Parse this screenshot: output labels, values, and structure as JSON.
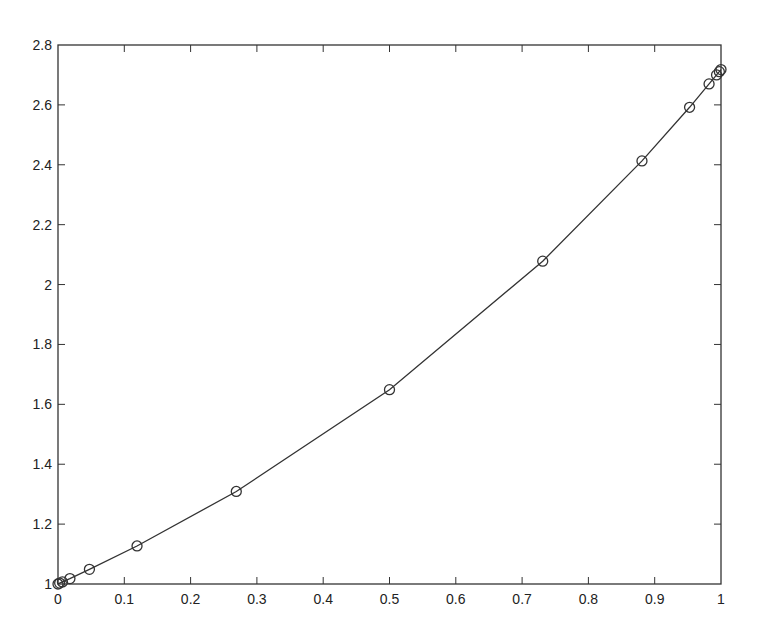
{
  "chart_data": {
    "type": "line",
    "title": "",
    "xlabel": "",
    "ylabel": "",
    "xlim": [
      0,
      1
    ],
    "ylim": [
      1,
      2.8
    ],
    "grid": false,
    "legend": null,
    "marker": "circle",
    "line_color": "#333333",
    "x_ticks": [
      "0",
      "0.1",
      "0.2",
      "0.3",
      "0.4",
      "0.5",
      "0.6",
      "0.7",
      "0.8",
      "0.9",
      "1"
    ],
    "y_ticks": [
      "1",
      "1.2",
      "1.4",
      "1.6",
      "1.8",
      "2",
      "2.2",
      "2.4",
      "2.6",
      "2.8"
    ],
    "series": [
      {
        "name": "y",
        "x": [
          0.0,
          0.0025,
          0.0067,
          0.018,
          0.0474,
          0.1192,
          0.2689,
          0.5,
          0.7311,
          0.8808,
          0.9526,
          0.982,
          0.9933,
          0.9975,
          1.0
        ],
        "y": [
          1.0,
          1.003,
          1.007,
          1.018,
          1.049,
          1.127,
          1.309,
          1.649,
          2.078,
          2.413,
          2.592,
          2.67,
          2.7,
          2.711,
          2.718
        ]
      }
    ]
  }
}
